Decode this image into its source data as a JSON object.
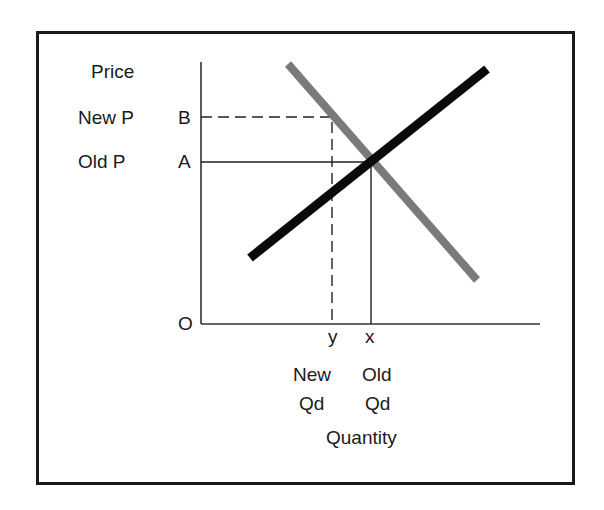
{
  "diagram": {
    "y_axis_label": "Price",
    "x_axis_label": "Quantity",
    "origin_label": "O",
    "price_labels": [
      {
        "name": "New P",
        "point": "B"
      },
      {
        "name": "Old P",
        "point": "A"
      }
    ],
    "quantity_labels": [
      {
        "point": "y",
        "line1": "New",
        "line2": "Qd"
      },
      {
        "point": "x",
        "line1": "Old",
        "line2": "Qd"
      }
    ],
    "curves": [
      {
        "name": "demand",
        "color": "#7a7a7a"
      },
      {
        "name": "supply",
        "color": "#0a0a0a"
      }
    ]
  }
}
